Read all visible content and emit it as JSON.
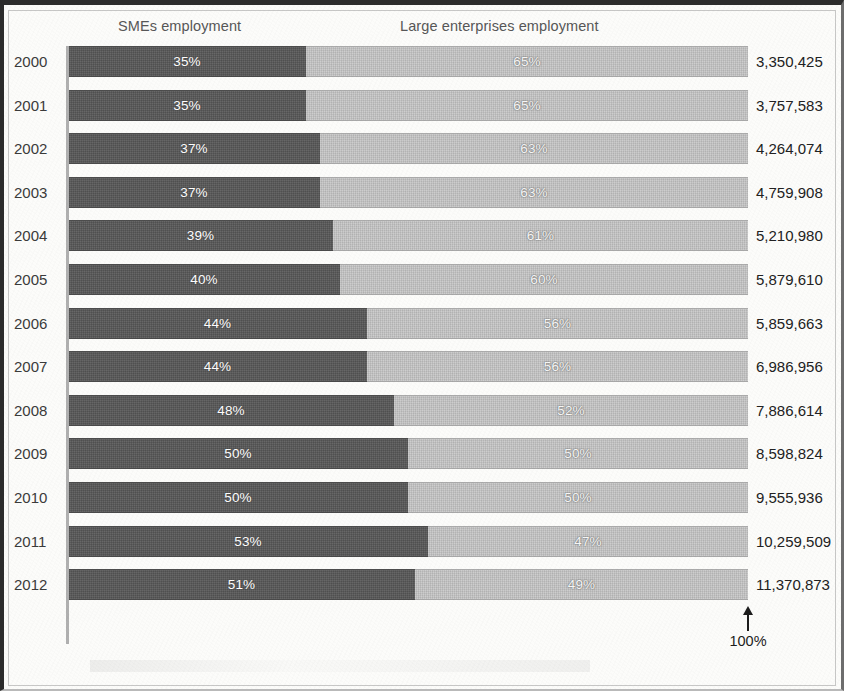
{
  "chart_data": {
    "type": "bar",
    "subtype": "stacked-horizontal-100-percent",
    "title": "",
    "xlabel": "",
    "ylabel": "",
    "xlim": [
      0,
      100
    ],
    "grid": false,
    "legend_position": "top",
    "categories": [
      "2000",
      "2001",
      "2002",
      "2003",
      "2004",
      "2005",
      "2006",
      "2007",
      "2008",
      "2009",
      "2010",
      "2011",
      "2012"
    ],
    "series": [
      {
        "name": "SMEs employment",
        "color": "#585858",
        "values": [
          35,
          35,
          37,
          37,
          39,
          40,
          44,
          44,
          48,
          50,
          50,
          53,
          51
        ],
        "labels": [
          "35%",
          "35%",
          "37%",
          "37%",
          "39%",
          "40%",
          "44%",
          "44%",
          "48%",
          "50%",
          "50%",
          "53%",
          "51%"
        ]
      },
      {
        "name": "Large enterprises employment",
        "color": "#c3c3c3",
        "values": [
          65,
          65,
          63,
          63,
          61,
          60,
          56,
          56,
          52,
          50,
          50,
          47,
          49
        ],
        "labels": [
          "65%",
          "65%",
          "63%",
          "63%",
          "61%",
          "60%",
          "56%",
          "56%",
          "52%",
          "50%",
          "50%",
          "47%",
          "49%"
        ]
      }
    ],
    "totals": [
      "3,350,425",
      "3,757,583",
      "4,264,074",
      "4,759,908",
      "5,210,980",
      "5,879,610",
      "5,859,663",
      "6,986,956",
      "7,886,614",
      "8,598,824",
      "9,555,936",
      "10,259,509",
      "11,370,873"
    ],
    "annotations": [
      {
        "text": "100%",
        "at_category": "axis-end",
        "arrow": "up"
      }
    ]
  },
  "headers": {
    "smes": "SMEs employment",
    "large": "Large enterprises employment"
  },
  "axis_note": {
    "label": "100%"
  },
  "colors": {
    "smes": "#585858",
    "large": "#c3c3c3",
    "axis": "#b0b0b0",
    "text": "#3b3b3b",
    "frame": "#2c2c2c"
  }
}
